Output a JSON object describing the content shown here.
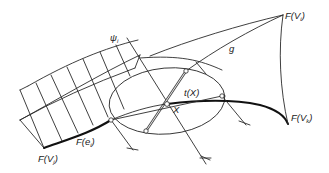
{
  "diagram": {
    "type": "geometric construction sketch",
    "labels": {
      "F_Vi": {
        "base": "F(V",
        "sub": "i",
        "close": ")"
      },
      "F_Vk": {
        "base": "F(V",
        "sub": "k",
        "close": ")"
      },
      "F_Vj": {
        "base": "F(V",
        "sub": "j",
        "close": ")"
      },
      "F_ei": {
        "base": "F(e",
        "sub": "i",
        "close": ")"
      },
      "t_X": "t(X)",
      "X": "X",
      "psi_i": {
        "base": "ψ",
        "sub": "i"
      },
      "g": "g"
    },
    "colors": {
      "line": "#2a2a2a",
      "background": "#ffffff"
    }
  }
}
